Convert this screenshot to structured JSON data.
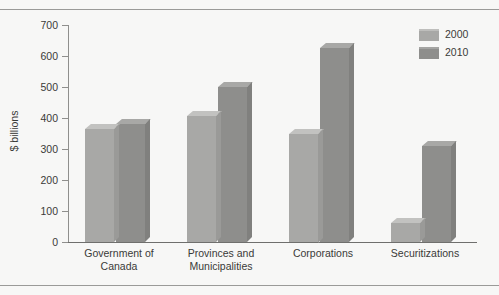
{
  "chart_data": {
    "type": "bar",
    "title": "",
    "subtitle": "",
    "xlabel": "",
    "ylabel": "$ billions",
    "ylim": [
      0,
      700
    ],
    "yticks": [
      0,
      100,
      200,
      300,
      400,
      500,
      600,
      700
    ],
    "ytick_labels": [
      "0",
      "100",
      "200",
      "300",
      "400",
      "500",
      "600",
      "700"
    ],
    "grid": false,
    "legend_position": "top-right",
    "categories": [
      "Government of\nCanada",
      "Provinces and\nMunicipalities",
      "Corporations",
      "Securitizations"
    ],
    "category_lines": [
      [
        "Government of",
        "Canada"
      ],
      [
        "Provinces and",
        "Municipalities"
      ],
      [
        "Corporations",
        ""
      ],
      [
        "Securitizations",
        ""
      ]
    ],
    "series": [
      {
        "name": "2000",
        "color": "#a8a8a6",
        "values": [
          365,
          405,
          350,
          60
        ]
      },
      {
        "name": "2010",
        "color": "#8e8e8c",
        "values": [
          380,
          500,
          625,
          310
        ]
      }
    ]
  },
  "legend": {
    "items": [
      {
        "label": "2000",
        "color": "#a8a8a6"
      },
      {
        "label": "2010",
        "color": "#8e8e8c"
      }
    ]
  },
  "axis": {
    "y_title": "$ billions"
  },
  "colors": {
    "background": "#f7f7f6",
    "frame": "#9a9a98",
    "axis": "#8f8f8d",
    "text": "#3a3a38",
    "series_2000": "#a8a8a6",
    "series_2010": "#8e8e8c"
  }
}
